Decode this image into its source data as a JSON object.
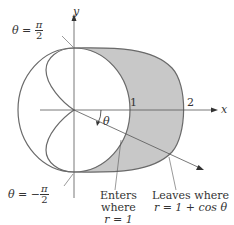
{
  "diagram": {
    "axes": {
      "x_label": "x",
      "y_label": "y",
      "tick_1": "1",
      "tick_2": "2"
    },
    "angle_label": "θ",
    "top_label": {
      "lhs": "θ = ",
      "num": "π",
      "den": "2"
    },
    "bottom_label": {
      "lhs": "θ = −",
      "num": "π",
      "den": "2"
    },
    "enters_label": [
      "Enters",
      "where",
      "r = 1"
    ],
    "leaves_label": [
      "Leaves where",
      "r = 1 + cos θ"
    ],
    "colors": {
      "shade": "#c8c8c8",
      "curve": "#6a6a6a",
      "axis": "#555555",
      "text": "#333333"
    },
    "curves": {
      "circle": "r = 1",
      "cardioid": "r = 1 + cos θ"
    }
  }
}
